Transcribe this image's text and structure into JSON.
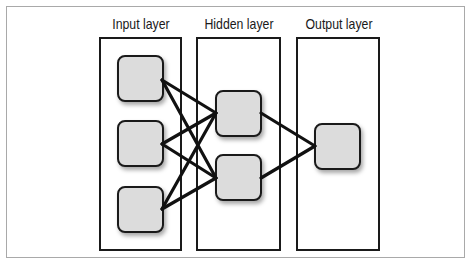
{
  "diagram": {
    "layers": [
      {
        "id": "input",
        "label": "Input layer",
        "nodes": 3
      },
      {
        "id": "hidden",
        "label": "Hidden layer",
        "nodes": 2
      },
      {
        "id": "output",
        "label": "Output layer",
        "nodes": 1
      }
    ],
    "connections": [
      {
        "from": "input-1",
        "to": "hidden-1"
      },
      {
        "from": "input-1",
        "to": "hidden-2"
      },
      {
        "from": "input-2",
        "to": "hidden-1"
      },
      {
        "from": "input-2",
        "to": "hidden-2"
      },
      {
        "from": "input-3",
        "to": "hidden-1"
      },
      {
        "from": "input-3",
        "to": "hidden-2"
      },
      {
        "from": "hidden-1",
        "to": "output-1"
      },
      {
        "from": "hidden-2",
        "to": "output-1"
      }
    ],
    "colors": {
      "node_fill": "#dcdcdc",
      "stroke": "#1a1a1a",
      "frame": "#a9a9a9"
    }
  }
}
